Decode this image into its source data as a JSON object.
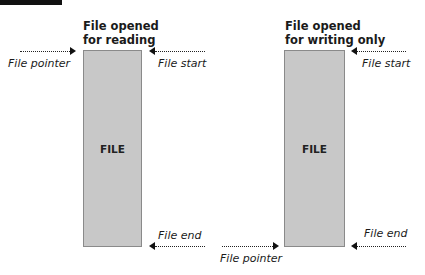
{
  "diagrams": [
    {
      "title_line1": "File opened",
      "title_line2": "for reading",
      "box_label": "FILE",
      "pointer_label": "File pointer",
      "start_label": "File start",
      "end_label": "File end",
      "pointer_position": "start"
    },
    {
      "title_line1": "File opened",
      "title_line2": "for writing only",
      "box_label": "FILE",
      "pointer_label": "File pointer",
      "start_label": "File start",
      "end_label": "File end",
      "pointer_position": "end"
    }
  ],
  "colors": {
    "file_box": "#c8c8c8",
    "file_border": "#8a8a8a",
    "arrow": "#111111"
  }
}
